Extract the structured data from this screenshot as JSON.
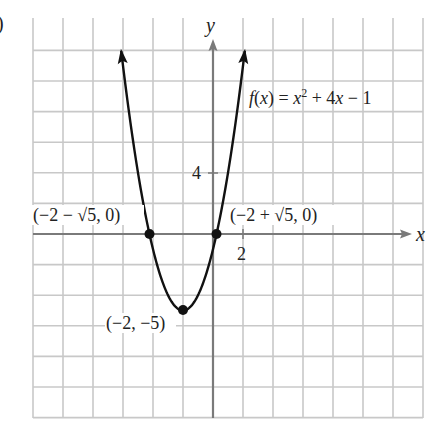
{
  "chart_data": {
    "type": "line",
    "title": "",
    "function_label": "f(x) = x² + 4x − 1",
    "function": "x^2 + 4x - 1",
    "xlabel": "x",
    "ylabel": "y",
    "x_tick_labels": [
      {
        "value": 2,
        "label": "2"
      }
    ],
    "y_tick_labels": [
      {
        "value": 4,
        "label": "4"
      }
    ],
    "xlim": [
      -12,
      14
    ],
    "ylim": [
      -12,
      12
    ],
    "grid": true,
    "grid_step": 2,
    "series": [
      {
        "name": "f(x) = x^2 + 4x - 1",
        "x_range": [
          -6.12,
          2.12
        ],
        "arrows_at_ends": true,
        "points": [
          {
            "x": -6.12,
            "y": 12
          },
          {
            "x": -4.236,
            "y": 0
          },
          {
            "x": -2,
            "y": -5
          },
          {
            "x": 0.236,
            "y": 0
          },
          {
            "x": 2.12,
            "y": 12
          }
        ]
      }
    ],
    "annotations": [
      {
        "label": "(−2 − √5, 0)",
        "x": -4.236,
        "y": 0,
        "marker": "dot"
      },
      {
        "label": "(−2 + √5, 0)",
        "x": 0.236,
        "y": 0,
        "marker": "dot"
      },
      {
        "label": "(−2, −5)",
        "x": -2,
        "y": -5,
        "marker": "dot"
      }
    ]
  },
  "labels": {
    "partial_corner": ")",
    "y_axis": "y",
    "x_axis": "x",
    "tick_x_2": "2",
    "tick_y_4": "4",
    "func_prefix": "f(x) = x",
    "func_sup": "2",
    "func_suffix": " + 4x − 1",
    "left_root": "(−2 − √5, 0)",
    "right_root": "(−2 + √5, 0)",
    "vertex": "(−2, −5)"
  },
  "colors": {
    "grid": "#c8c8c8",
    "axis": "#7a7a7a",
    "curve": "#111111",
    "text": "#222222"
  }
}
